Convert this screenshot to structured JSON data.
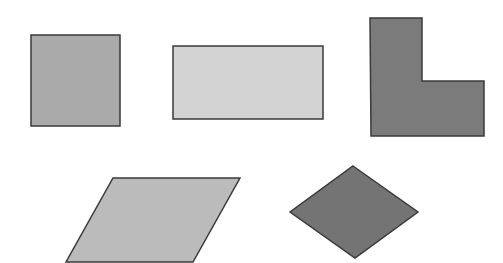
{
  "canvas": {
    "width": 503,
    "height": 263,
    "background": "#ffffff"
  },
  "stroke": {
    "color": "#3a3a3a",
    "width": 1.5
  },
  "shapes": [
    {
      "name": "square",
      "fill": "#aaaaaa",
      "points": "31,35 120,35 120,126 31,126"
    },
    {
      "name": "rectangle",
      "fill": "#d3d3d3",
      "points": "173,46 323,46 323,119 173,119"
    },
    {
      "name": "l-shape",
      "fill": "#7b7b7b",
      "points": "370,18 422,18 422,81 484,81 484,136 371,136"
    },
    {
      "name": "parallelogram",
      "fill": "#bbbbbb",
      "points": "113,178 240,178 193,262 66,262"
    },
    {
      "name": "rhombus",
      "fill": "#747474",
      "points": "353,166 418,212 355,258 290,212"
    }
  ]
}
